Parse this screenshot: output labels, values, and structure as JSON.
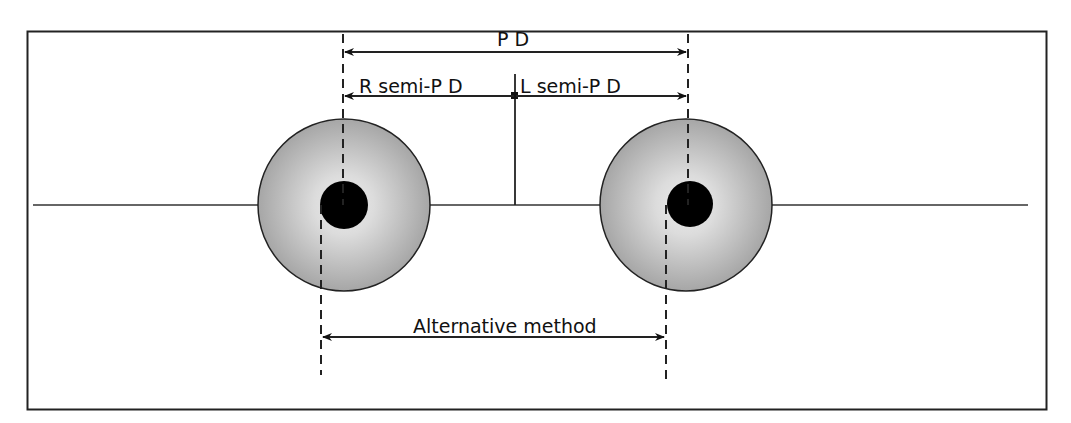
{
  "diagram": {
    "type": "pupillary-distance-measurement",
    "labels": {
      "pd": "P D",
      "right_semi_pd": "R semi-P D",
      "left_semi_pd": "L semi-P D",
      "alternative": "Alternative method"
    },
    "colors": {
      "frame": "#222222",
      "line": "#222222",
      "iris_center": "#e6e6e6",
      "iris_edge": "#a8a8a8",
      "pupil": "#000000"
    },
    "eyes": [
      {
        "name": "right-eye",
        "cx": 344,
        "cy": 205,
        "iris_r": 86,
        "pupil_cx": 344,
        "pupil_r": 24
      },
      {
        "name": "left-eye",
        "cx": 686,
        "cy": 205,
        "iris_r": 86,
        "pupil_cx": 690,
        "pupil_r": 23
      }
    ]
  }
}
